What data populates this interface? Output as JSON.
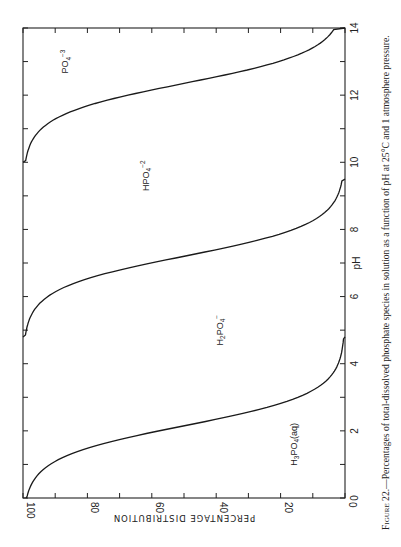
{
  "chart_data": {
    "type": "line",
    "orientation": "rotated-90-clockwise",
    "title": "",
    "caption": "Figure 22.—Percentages of total-dissolved phosphate species in solution as a function of pH at 25°C and 1 atmosphere pressure.",
    "caption_prefix": "Figure 22.",
    "caption_body": "—Percentages of total-dissolved phosphate species in solution as a function of pH at 25°C and 1 atmosphere pressure.",
    "xlabel": "pH",
    "ylabel": "PERCENTAGE DISTRIBUTION",
    "xlim": [
      0,
      14
    ],
    "ylim": [
      0,
      100
    ],
    "x_ticks": [
      0,
      2,
      4,
      6,
      8,
      10,
      12,
      14
    ],
    "y_ticks": [
      0,
      20,
      40,
      60,
      80,
      100
    ],
    "grid": false,
    "legend": "none (species labeled in regions)",
    "region_labels": [
      {
        "id": "h3po4",
        "text": "H3PO4(aq)",
        "main": "H",
        "sub1": "3",
        "mid": "PO",
        "sub2": "4",
        "tail": "(aq)",
        "pH": 1.6,
        "pct": 15
      },
      {
        "id": "h2po4",
        "text": "H2PO4−",
        "main": "H",
        "sub1": "2",
        "mid": "PO",
        "sub2": "4",
        "tail": "−",
        "pH": 5.0,
        "pct": 38
      },
      {
        "id": "hpo4",
        "text": "HPO4−2",
        "main": "HPO",
        "sub2": "4",
        "tail": "−2",
        "pH": 9.6,
        "pct": 61
      },
      {
        "id": "po4",
        "text": "PO4−3",
        "main": "PO",
        "sub2": "4",
        "tail": "−3",
        "pH": 13.0,
        "pct": 86
      }
    ],
    "series": [
      {
        "name": "H3PO4 / H2PO4- boundary",
        "pKa": 2.15,
        "x": [
          0,
          0.5,
          1,
          1.5,
          2,
          2.5,
          3,
          3.5,
          4,
          4.8
        ],
        "values": [
          99,
          97,
          93,
          82,
          59,
          31,
          12,
          4,
          1.4,
          0
        ]
      },
      {
        "name": "H2PO4- / HPO4-2 boundary",
        "pKa": 7.2,
        "x": [
          4.8,
          5.5,
          6,
          6.5,
          7,
          7.5,
          8,
          8.5,
          9,
          9.5
        ],
        "values": [
          100,
          98,
          94,
          83,
          61,
          33,
          14,
          5,
          1.6,
          0
        ]
      },
      {
        "name": "HPO4-2 / PO4-3 boundary",
        "pKa": 12.35,
        "x": [
          10,
          10.5,
          11,
          11.5,
          12,
          12.5,
          13,
          13.5,
          14
        ],
        "values": [
          100,
          98,
          96,
          88,
          69,
          41,
          18,
          7,
          0
        ]
      }
    ]
  }
}
